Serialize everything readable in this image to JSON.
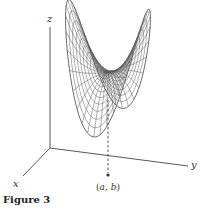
{
  "figure": {
    "caption": "Figure 3",
    "axes": {
      "x_label": "x",
      "y_label": "y",
      "z_label": "z",
      "origin": [
        50,
        148
      ],
      "z_end": [
        50,
        27
      ],
      "x_end": [
        23,
        176
      ],
      "y_end": [
        188,
        166
      ]
    },
    "point": {
      "label_open": "(",
      "a": "a",
      "sep": ", ",
      "b": "b",
      "label_close": ")",
      "position": [
        108,
        175
      ],
      "dashed_top_y": 100
    },
    "surface": {
      "type": "saddle",
      "stroke_color": "#555555",
      "description": "Saddle-shaped wireframe surface with two raised ends and a dip centered above the point (a, b)"
    },
    "colors": {
      "background": "#ffffff",
      "axis": "#444444",
      "mesh": "#5a5a5a",
      "text": "#333333"
    }
  }
}
